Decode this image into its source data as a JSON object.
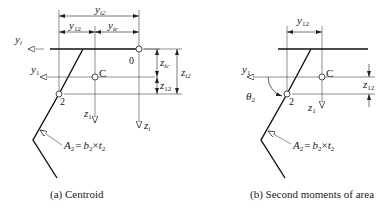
{
  "diagram_a": {
    "caption": "(a) Centroid",
    "labels": {
      "yi_axis": "y",
      "yi_axis_sub": "i",
      "y1_axis": "y",
      "y1_axis_sub": "1",
      "z1_axis": "z",
      "z1_axis_sub": "1",
      "zi_axis": "z",
      "zi_axis_sub": "i",
      "point_0": "0",
      "point_2": "2",
      "point_c": "C",
      "dim_yi2": "y",
      "dim_yi2_sub": "i2",
      "dim_y12": "y",
      "dim_y12_sub": "12",
      "dim_yic": "y",
      "dim_yic_sub": "ic",
      "dim_zic": "z",
      "dim_zic_sub": "ic",
      "dim_z12": "z",
      "dim_z12_sub": "12",
      "dim_zi2": "z",
      "dim_zi2_sub": "i2",
      "area_A": "A",
      "area_A_sub": "2",
      "area_eq": "=",
      "area_b": "b",
      "area_b_sub": "2",
      "area_times": "×",
      "area_t": "t",
      "area_t_sub": "2"
    }
  },
  "diagram_b": {
    "caption": "(b) Second moments of area",
    "labels": {
      "y1_axis": "y",
      "y1_axis_sub": "1",
      "z1_axis": "z",
      "z1_axis_sub": "1",
      "point_2": "2",
      "point_c": "C",
      "theta": "θ",
      "theta_sub": "2",
      "dim_y12": "y",
      "dim_y12_sub": "12",
      "dim_z12": "z",
      "dim_z12_sub": "12",
      "area_A": "A",
      "area_A_sub": "2",
      "area_eq": "=",
      "area_b": "b",
      "area_b_sub": "2",
      "area_times": "×",
      "area_t": "t",
      "area_t_sub": "2"
    }
  },
  "colors": {
    "line": "#222222",
    "thin": "#444444",
    "background": "#ffffff"
  }
}
